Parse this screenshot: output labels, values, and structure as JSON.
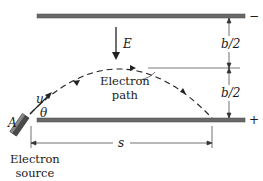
{
  "diagram": {
    "labels": {
      "field": "E",
      "half_gap_upper": "b/2",
      "half_gap_lower": "b/2",
      "path_line1": "Electron",
      "path_line2": "path",
      "velocity": "u",
      "angle": "θ",
      "point": "A",
      "range": "s",
      "source_line1": "Electron",
      "source_line2": "source",
      "top_plate_polarity": "−",
      "bottom_plate_polarity": "+"
    },
    "colors": {
      "plate": "#555555",
      "line": "#222222",
      "background": "#ffffff"
    }
  }
}
